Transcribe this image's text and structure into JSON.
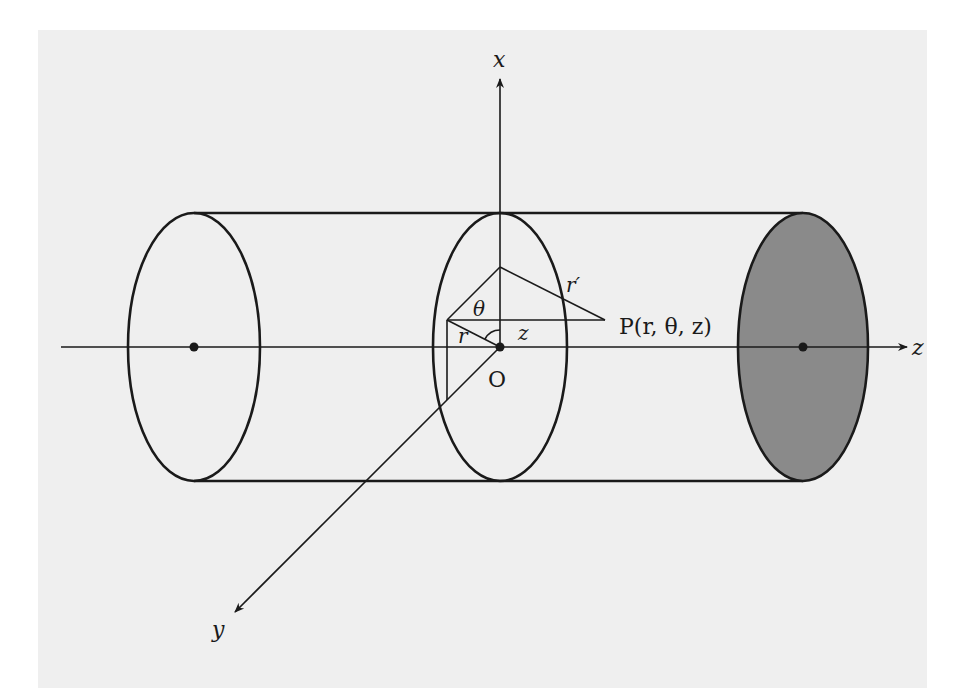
{
  "figure": {
    "colors": {
      "panel": "#efefef",
      "ink": "#1a1a1a",
      "shaded_face": "#8a8a8a"
    },
    "axes": {
      "x_label": "x",
      "y_label": "y",
      "z_label": "z"
    },
    "labels": {
      "origin": "O",
      "theta": "θ",
      "r": "r",
      "r_prime": "r′",
      "z": "z",
      "point": "P(r, θ, z)"
    },
    "ellipses": [
      {
        "name": "left-end-face",
        "cx": 194,
        "cy": 347,
        "rx": 66,
        "ry": 134,
        "filled": false
      },
      {
        "name": "middle-cross-section",
        "cx": 500,
        "cy": 347,
        "rx": 67,
        "ry": 134,
        "filled": false
      },
      {
        "name": "right-end-face",
        "cx": 803,
        "cy": 347,
        "rx": 65,
        "ry": 134,
        "filled": true
      }
    ]
  }
}
